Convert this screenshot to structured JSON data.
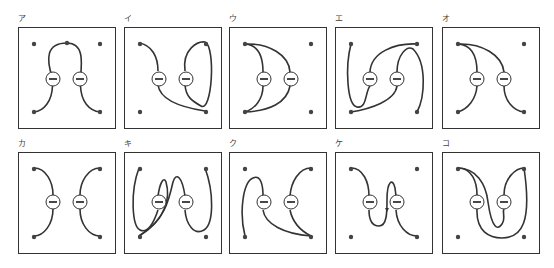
{
  "figure": {
    "panels": [
      {
        "label": "ア",
        "x": 18,
        "y": 27,
        "curves": [
          "M34.5,51 C28,32 28,16 49,16 C66,16 64,35 62.5,51",
          "M34.5,59 C34,74 26,84 16,85",
          "M62.5,59 C63,74 71,84 82,85"
        ]
      },
      {
        "label": "イ",
        "x": 124,
        "y": 27,
        "curves": [
          "M15,16 C28,18 34,30 34,44",
          "M34,58 C36,72 55,80 81,84",
          "M61,44 C58,22 74,14 81,15 C92,20 88,86 77,79 C68,74 62,70 61,58"
        ]
      },
      {
        "label": "ウ",
        "x": 229,
        "y": 27,
        "curves": [
          "M16,17 C30,18 34,30 34,45",
          "M34,59 C34,72 26,82 16,85",
          "M16,17 C40,16 60,28 61,45",
          "M61,59 C58,76 40,84 16,85"
        ]
      },
      {
        "label": "エ",
        "x": 335,
        "y": 27,
        "curves": [
          "M16,17 C10,40 12,78 22,80 C32,82 30,65 35,59",
          "M35,45 C36,25 60,16 82,17",
          "M62,45 C62,28 72,18 78,22 C92,36 90,70 82,85",
          "M62,59 C60,74 35,82 16,85"
        ]
      },
      {
        "label": "オ",
        "x": 442,
        "y": 27,
        "curves": [
          "M16,17 C30,18 35,30 35,45",
          "M35,59 C34,72 26,82 16,85",
          "M16,17 C40,16 60,28 62,45",
          "M62,59 C62,74 72,84 82,85"
        ]
      },
      {
        "label": "カ",
        "x": 18,
        "y": 152,
        "curves": [
          "M16,16 C28,16 35,30 35,43",
          "M35,57 C35,72 26,84 16,84",
          "M82,16 C70,16 62,30 62,43",
          "M62,57 C62,72 71,84 82,84"
        ]
      },
      {
        "label": "キ",
        "x": 124,
        "y": 152,
        "curves": [
          "M15,16 C6,40 8,74 16,78 C24,82 30,70 34,58",
          "M34,44 C36,30 40,24 42,30 C46,44 44,66 15,84",
          "M61,44 C58,24 52,20 49,30 C45,48 40,70 15,84",
          "M81,16 C90,40 90,72 80,78 C70,84 62,72 61,58"
        ]
      },
      {
        "label": "ク",
        "x": 229,
        "y": 152,
        "curves": [
          "M16,84 C10,60 14,30 24,26 C32,22 34,34 34,44",
          "M34,58 C36,72 55,82 82,84",
          "M82,16 C70,16 62,30 61,44",
          "M61,58 C64,72 74,80 82,84"
        ]
      },
      {
        "label": "ケ",
        "x": 335,
        "y": 152,
        "curves": [
          "M16,16 C28,16 34,30 34,44",
          "M34,58 C34,70 38,74 44,74 C52,74 52,60 52,48 C52,28 58,26 60,36 L61,44",
          "M61,58 C62,74 72,84 82,84"
        ],
        "arrow": "M52,60 L50,56 L54,56 Z"
      },
      {
        "label": "コ",
        "x": 442,
        "y": 152,
        "curves": [
          "M16,16 C30,16 35,30 35,43",
          "M16,16 C34,16 44,32 46,50 C50,78 56,78 60,72 C64,66 60,60 62,57",
          "M62,43 C62,26 74,16 82,16",
          "M35,57 C34,80 48,86 60,86 C80,86 90,70 82,16"
        ]
      }
    ],
    "charge_symbol": "minus",
    "colors": {
      "stroke": "#333333",
      "background": "#ffffff"
    }
  }
}
